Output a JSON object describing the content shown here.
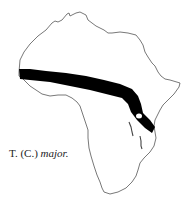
{
  "figure": {
    "caption_prefix": "T. (C.) ",
    "caption_species": "major.",
    "region": "Africa",
    "range_band_color": "#000000",
    "outline_color": "#555555"
  }
}
